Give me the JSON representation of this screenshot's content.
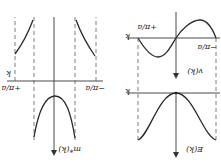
{
  "orientation": "rotated-180",
  "left_panel": {
    "title": "effective mass vs wavevector",
    "y_label": "m*(k)",
    "x_label": "k",
    "tick_pos": "+π/a",
    "tick_neg": "−π/a"
  },
  "right_top_panel": {
    "title": "group velocity vs wavevector",
    "y_label": "v(k)",
    "x_label": "k",
    "tick_pos": "+π/a",
    "tick_neg": "−π/a"
  },
  "right_bottom_panel": {
    "title": "energy vs wavevector",
    "y_label": "E(k)",
    "x_label": "k"
  },
  "colors": {
    "curve": "#2a2a2a",
    "axis": "#4a4a4a",
    "background": "#ffffff"
  }
}
